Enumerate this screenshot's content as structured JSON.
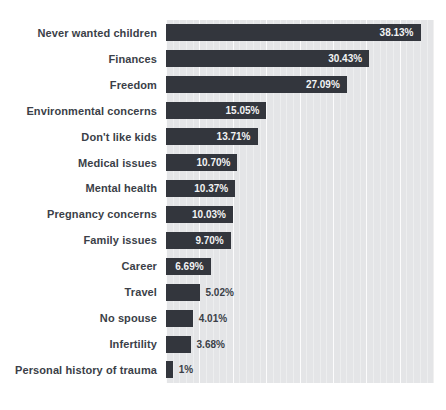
{
  "chart_data": {
    "type": "bar",
    "orientation": "horizontal",
    "title": "",
    "xlabel": "",
    "ylabel": "",
    "legend": "none",
    "xlim": [
      0,
      40
    ],
    "grid": "faint white vertical gridlines on gray panel, minor every 1, major every 5",
    "categories": [
      "Never wanted children",
      "Finances",
      "Freedom",
      "Environmental concerns",
      "Don't like kids",
      "Medical issues",
      "Mental health",
      "Pregnancy concerns",
      "Family issues",
      "Career",
      "Travel",
      "No spouse",
      "Infertility",
      "Personal history of trauma"
    ],
    "values": [
      38.13,
      30.43,
      27.09,
      15.05,
      13.71,
      10.7,
      10.37,
      10.03,
      9.7,
      6.69,
      5.02,
      4.01,
      3.68,
      1
    ],
    "value_labels": [
      "38.13%",
      "30.43%",
      "27.09%",
      "15.05%",
      "13.71%",
      "10.70%",
      "10.37%",
      "10.03%",
      "9.70%",
      "6.69%",
      "5.02%",
      "4.01%",
      "3.68%",
      "1%"
    ],
    "label_placement": [
      "inside",
      "inside",
      "inside",
      "inside",
      "inside",
      "inside",
      "inside",
      "inside",
      "inside",
      "inside",
      "outside",
      "outside",
      "outside",
      "outside"
    ]
  },
  "colors": {
    "bar": "#33363d",
    "plot_background": "#e4e5e7",
    "page_background": "#ffffff",
    "category_label_text": "#3b3f48",
    "value_label_inside": "#f2f3f4",
    "value_label_outside": "#3b3f48",
    "gridline": "#ffffff"
  }
}
